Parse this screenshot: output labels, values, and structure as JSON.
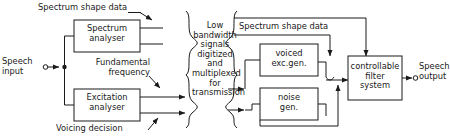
{
  "diagram": {
    "colors": {
      "line": "#1a1a1a",
      "text": "#1a1a1a",
      "background": "#ffffff"
    },
    "boxes": [
      {
        "id": "spectrum-analyser",
        "label": "Spectrum\nanalyser"
      },
      {
        "id": "excitation-analyser",
        "label": "Excitation\nanalyser"
      },
      {
        "id": "voiced-exc-gen",
        "label": "voiced\nexc.gen."
      },
      {
        "id": "noise-gen",
        "label": "noise\ngen."
      },
      {
        "id": "controllable-filter-system",
        "label": "controllable\nfilter\nsystem"
      }
    ],
    "labels": {
      "spectrum_shape_data_left": "Spectrum shape data",
      "speech_input": "Speech\ninput",
      "fundamental_frequency": "Fundamental\nfrequency",
      "voicing_decision": "Voicing decision",
      "channel": "Low\nbandwidth\nsignals\ndigitized\nand\nmultiplexed\nfor\ntransmission",
      "spectrum_shape_data_right": "Spectrum shape data",
      "speech_output": "Speech\noutput"
    }
  }
}
